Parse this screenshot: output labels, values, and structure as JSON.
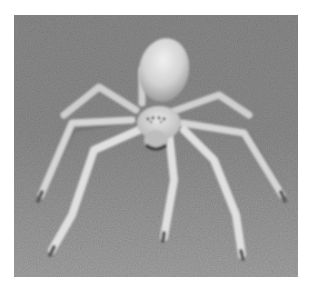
{
  "image": {
    "description": "Grayscale close-up photo of a pale spider standing on sandy ground",
    "subject": "spider",
    "background": "sand",
    "colors": {
      "page_background": "#ffffff",
      "sand_dark": "#6e6e6e",
      "sand_mid": "#909090",
      "sand_light": "#b0b0b0",
      "spider_body": "#d8d8d8",
      "spider_highlight": "#ededed",
      "spider_shadow": "#9a9a9a"
    }
  }
}
